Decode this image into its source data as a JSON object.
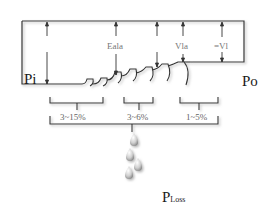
{
  "labels": {
    "input_power": "Pi",
    "output_power": "Po",
    "eala": "Eala",
    "vla": "Vla",
    "vl": "=Vl",
    "loss_main": "P",
    "loss_sub": "Loss"
  },
  "percentages": [
    {
      "id": "segment-1",
      "label": "3~15%"
    },
    {
      "id": "segment-2",
      "label": "3~6%"
    },
    {
      "id": "segment-3",
      "label": "1~5%"
    }
  ],
  "colors": {
    "line": "#333333",
    "shadow": "#bbbbbb",
    "text_dark": "#1a1a1a",
    "text_gray": "#777777"
  }
}
